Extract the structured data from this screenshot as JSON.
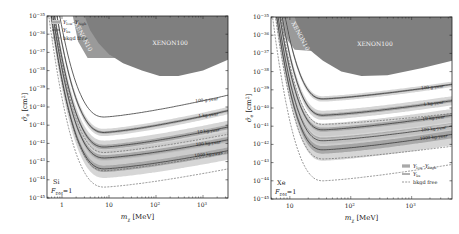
{
  "figure": {
    "width": 459,
    "height": 234
  },
  "colors": {
    "xenon10": "#9a9a9a",
    "xenon100": "#7f7f7f",
    "band": "#c8c8c8",
    "band_dark": "#8a8a8a",
    "median": "#3a3a3a",
    "bkgd_free": "#555555",
    "frame": "#222222",
    "label_bg": "#d6d6d6"
  },
  "chart_data": [
    {
      "type": "line",
      "panel": "left",
      "frame": {
        "x0": 47,
        "y0": 16,
        "x1": 228,
        "y1": 198
      },
      "xscale": "log",
      "yscale": "log",
      "xlim": [
        0.48,
        3400
      ],
      "ylim": [
        1e-45,
        1e-35
      ],
      "xlabel": "m_χ [MeV]",
      "ylabel": "σ̄_e [cm²]",
      "xticks": [
        {
          "v": 1,
          "label": "1"
        },
        {
          "v": 10,
          "label": "10"
        },
        {
          "v": 100,
          "label": "10²"
        },
        {
          "v": 1000,
          "label": "10³"
        }
      ],
      "yticks": [
        -35,
        -36,
        -37,
        -38,
        -39,
        -40,
        -41,
        -42,
        -43,
        -44,
        -45
      ],
      "target": "Si",
      "form_factor": "F_DM=1",
      "legend": {
        "position": "upper left",
        "entries": [
          "Y_low–Y_high",
          "Y_bs",
          "bkgd free"
        ]
      },
      "exclusion_regions": [
        {
          "name": "XENON10",
          "points": [
            [
              0.48,
              -35
            ],
            [
              3.0,
              -35
            ],
            [
              4.5,
              -35.8
            ],
            [
              9,
              -36.9
            ],
            [
              14,
              -37.3
            ],
            [
              3.5,
              -37.3
            ],
            [
              2.2,
              -36.4
            ],
            [
              1.7,
              -35
            ]
          ]
        },
        {
          "name": "XENON100",
          "points": [
            [
              3.0,
              -35
            ],
            [
              3400,
              -35
            ],
            [
              3400,
              -37.4
            ],
            [
              1000,
              -38.0
            ],
            [
              300,
              -38.3
            ],
            [
              120,
              -38.3
            ],
            [
              50,
              -38.0
            ],
            [
              20,
              -37.6
            ],
            [
              10,
              -37.1
            ],
            [
              6,
              -36.5
            ],
            [
              4,
              -35.8
            ]
          ]
        }
      ],
      "series": [
        {
          "name": "100 g-year",
          "min_y": -40.55,
          "y_at_right": -39.35,
          "band_width": 0.0,
          "label_x": 1200
        },
        {
          "name": "1 kg-year",
          "min_y": -41.4,
          "y_at_right": -40.2,
          "band_width": 0.2,
          "label_x": 1300
        },
        {
          "name": "10 kg-year",
          "min_y": -42.2,
          "y_at_right": -41.1,
          "band_width": 0.35,
          "label_x": 1300
        },
        {
          "name": "100 kg-year",
          "min_y": -42.8,
          "y_at_right": -41.8,
          "band_width": 0.45,
          "label_x": 1300
        },
        {
          "name": "1000 kg-year",
          "min_y": -43.4,
          "y_at_right": -42.4,
          "band_width": 0.5,
          "label_x": 1300
        }
      ],
      "bkgd_free_curves": [
        {
          "min_y": -42.5,
          "y_at_right": -41.5
        },
        {
          "min_y": -43.5,
          "y_at_right": -42.5
        },
        {
          "min_y": -44.4,
          "y_at_right": -43.4
        }
      ],
      "curve_min_x": 8,
      "curve_left_rise_x": 0.55
    },
    {
      "type": "line",
      "panel": "right",
      "frame": {
        "x0": 271,
        "y0": 17,
        "x1": 452,
        "y1": 199
      },
      "xscale": "log",
      "yscale": "log",
      "xlim": [
        4.9,
        4600
      ],
      "ylim": [
        1e-45,
        1e-35
      ],
      "xlabel": "m_χ [MeV]",
      "ylabel": "σ̄_e [cm²]",
      "xticks": [
        {
          "v": 10,
          "label": "10"
        },
        {
          "v": 100,
          "label": "10²"
        },
        {
          "v": 1000,
          "label": "10³"
        }
      ],
      "yticks": [
        -35,
        -36,
        -37,
        -38,
        -39,
        -40,
        -41,
        -42,
        -43,
        -44,
        -45
      ],
      "target": "Xe",
      "form_factor": "F_DM=1",
      "legend": {
        "position": "lower right",
        "entries": [
          "Y_low–Y_high",
          "Y_bs",
          "bkgd free"
        ]
      },
      "exclusion_regions": [
        {
          "name": "XENON10",
          "points": [
            [
              4.9,
              -35
            ],
            [
              18,
              -35
            ],
            [
              25,
              -36.2
            ],
            [
              30,
              -36.9
            ],
            [
              12,
              -36.8
            ],
            [
              8,
              -36.0
            ],
            [
              7,
              -35
            ]
          ]
        },
        {
          "name": "XENON100",
          "points": [
            [
              12,
              -35
            ],
            [
              4600,
              -35
            ],
            [
              4600,
              -37.4
            ],
            [
              1500,
              -37.8
            ],
            [
              400,
              -38.2
            ],
            [
              150,
              -38.25
            ],
            [
              70,
              -38.0
            ],
            [
              35,
              -37.4
            ],
            [
              25,
              -37.0
            ],
            [
              18,
              -36.6
            ],
            [
              15,
              -36.0
            ]
          ]
        }
      ],
      "series": [
        {
          "name": "100 g-year",
          "min_y": -39.5,
          "y_at_right": -38.7,
          "band_width": 0.15,
          "label_x": 2200
        },
        {
          "name": "1 kg-year",
          "min_y": -40.4,
          "y_at_right": -39.6,
          "band_width": 0.25,
          "label_x": 2300
        },
        {
          "name": "10 kg-year",
          "min_y": -41.2,
          "y_at_right": -40.4,
          "band_width": 0.35,
          "label_x": 2300
        },
        {
          "name": "100 kg-year",
          "min_y": -41.8,
          "y_at_right": -41.0,
          "band_width": 0.5,
          "label_x": 2300
        },
        {
          "name": "1000 kg-year",
          "min_y": -42.3,
          "y_at_right": -41.45,
          "band_width": 0.6,
          "label_x": 2300
        }
      ],
      "bkgd_free_curves": [
        {
          "min_y": -40.9,
          "y_at_right": -40.3
        },
        {
          "min_y": -42.8,
          "y_at_right": -42.1
        },
        {
          "min_y": -44.0,
          "y_at_right": -43.1
        }
      ],
      "curve_min_x": 35,
      "curve_left_rise_x": 5.2
    }
  ]
}
